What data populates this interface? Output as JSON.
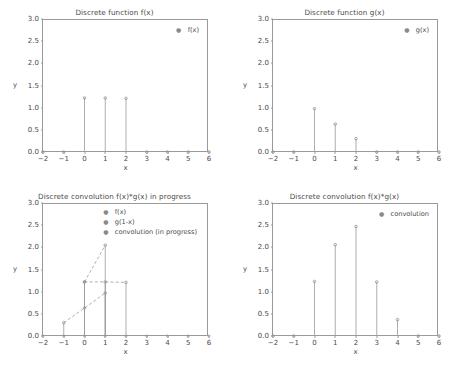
{
  "figure": {
    "background": "#ffffff",
    "line_color": "#9a9a9a",
    "text_color": "#4a4a4a",
    "marker_color": "#8a8a8a"
  },
  "axis_common": {
    "xlabel": "x",
    "ylabel": "y",
    "xticks": [
      "-2",
      "-1",
      "0",
      "1",
      "2",
      "3",
      "4",
      "5",
      "6"
    ],
    "yticks": [
      "0.0",
      "0.5",
      "1.0",
      "1.5",
      "2.0",
      "2.5",
      "3.0"
    ],
    "xlim": [
      -2,
      6
    ],
    "ylim": [
      0,
      3
    ]
  },
  "chart_data": [
    {
      "id": "f",
      "type": "scatter",
      "title": "Discrete function f(x)",
      "xlabel": "x",
      "ylabel": "y",
      "xlim": [
        -2,
        6
      ],
      "ylim": [
        0,
        3
      ],
      "grid": false,
      "legend_position": "upper right",
      "legend": [
        "f(x)"
      ],
      "series": [
        {
          "name": "f(x)",
          "style": "stem",
          "x": [
            -2,
            -1,
            0,
            1,
            2,
            3,
            4,
            5,
            6
          ],
          "values": [
            0,
            0,
            1.22,
            1.22,
            1.21,
            0,
            0,
            0,
            0
          ]
        }
      ]
    },
    {
      "id": "g",
      "type": "scatter",
      "title": "Discrete function g(x)",
      "xlabel": "x",
      "ylabel": "y",
      "xlim": [
        -2,
        6
      ],
      "ylim": [
        0,
        3
      ],
      "grid": false,
      "legend_position": "upper right",
      "legend": [
        "g(x)"
      ],
      "series": [
        {
          "name": "g(x)",
          "style": "stem",
          "x": [
            -2,
            -1,
            0,
            1,
            2,
            3,
            4,
            5,
            6
          ],
          "values": [
            0,
            0,
            0.98,
            0.63,
            0.3,
            0,
            0,
            0,
            0
          ]
        }
      ]
    },
    {
      "id": "conv-progress",
      "type": "line",
      "title": "Discrete convolution f(x)*g(x) in progress",
      "xlabel": "x",
      "ylabel": "y",
      "xlim": [
        -2,
        6
      ],
      "ylim": [
        0,
        3
      ],
      "grid": false,
      "legend_position": "upper center",
      "legend": [
        "f(x)",
        "g(1-x)",
        "convolution (in progress)"
      ],
      "series": [
        {
          "name": "f(x)",
          "style": "dashed-stem",
          "x": [
            0,
            1,
            2
          ],
          "values": [
            1.22,
            1.22,
            1.21
          ]
        },
        {
          "name": "g(1-x)",
          "style": "dashed-stem",
          "x": [
            -1,
            0,
            1
          ],
          "values": [
            0.3,
            0.63,
            0.97
          ]
        },
        {
          "name": "convolution (in progress)",
          "style": "dashed-stem",
          "x": [
            0,
            1
          ],
          "values": [
            1.22,
            2.05
          ]
        }
      ],
      "baseline_points": [
        -2,
        -1,
        0,
        1,
        2,
        3,
        4,
        5,
        6
      ]
    },
    {
      "id": "conv-final",
      "type": "scatter",
      "title": "Discrete convolution f(x)*g(x)",
      "xlabel": "x",
      "ylabel": "y",
      "xlim": [
        -2,
        6
      ],
      "ylim": [
        0,
        3
      ],
      "grid": false,
      "legend_position": "upper right",
      "legend": [
        "convolution"
      ],
      "series": [
        {
          "name": "convolution",
          "style": "stem",
          "x": [
            -2,
            -1,
            0,
            1,
            2,
            3,
            4,
            5,
            6
          ],
          "values": [
            0,
            0,
            1.23,
            2.06,
            2.47,
            1.22,
            0.37,
            0,
            0
          ]
        }
      ]
    }
  ]
}
